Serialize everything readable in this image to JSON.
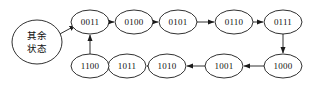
{
  "diagram": {
    "type": "state-transition-diagram",
    "background_color": "#ffffff",
    "stroke_color": "#1a1a1a",
    "text_color": "#111111",
    "nodes": [
      {
        "id": "other",
        "label_line1": "其余",
        "label_line2": "状态",
        "cx": 37,
        "cy": 42,
        "rx": 25,
        "ry": 22
      },
      {
        "id": "s0011",
        "label": "0011",
        "cx": 90,
        "cy": 22,
        "rx": 19,
        "ry": 12
      },
      {
        "id": "s0100",
        "label": "0100",
        "cx": 134,
        "cy": 22,
        "rx": 19,
        "ry": 12
      },
      {
        "id": "s0101",
        "label": "0101",
        "cx": 178,
        "cy": 22,
        "rx": 19,
        "ry": 12
      },
      {
        "id": "s0110",
        "label": "0110",
        "cx": 234,
        "cy": 22,
        "rx": 19,
        "ry": 12
      },
      {
        "id": "s0111",
        "label": "0111",
        "cx": 283,
        "cy": 22,
        "rx": 19,
        "ry": 12
      },
      {
        "id": "s1000",
        "label": "1000",
        "cx": 283,
        "cy": 66,
        "rx": 19,
        "ry": 12
      },
      {
        "id": "s1001",
        "label": "1001",
        "cx": 224,
        "cy": 66,
        "rx": 19,
        "ry": 12
      },
      {
        "id": "s1010",
        "label": "1010",
        "cx": 167,
        "cy": 66,
        "rx": 19,
        "ry": 12
      },
      {
        "id": "s1011",
        "label": "1011",
        "cx": 127,
        "cy": 66,
        "rx": 19,
        "ry": 12
      },
      {
        "id": "s1100",
        "label": "1100",
        "cx": 90,
        "cy": 66,
        "rx": 19,
        "ry": 12
      }
    ],
    "edges": [
      {
        "id": "other-to-0011",
        "from": "other",
        "to": "s0011",
        "x1": 58,
        "y1": 34,
        "x2": 74,
        "y2": 25,
        "direction": "diagonal-up-right"
      },
      {
        "id": "0011-to-0100",
        "from": "s0011",
        "to": "s0100",
        "x1": 109,
        "y1": 22,
        "x2": 114,
        "y2": 22,
        "direction": "right"
      },
      {
        "id": "0100-to-0101",
        "from": "s0100",
        "to": "s0101",
        "x1": 153,
        "y1": 22,
        "x2": 158,
        "y2": 22,
        "direction": "right"
      },
      {
        "id": "0101-to-0110",
        "from": "s0101",
        "to": "s0110",
        "x1": 197,
        "y1": 22,
        "x2": 214,
        "y2": 22,
        "direction": "right"
      },
      {
        "id": "0110-to-0111",
        "from": "s0110",
        "to": "s0111",
        "x1": 253,
        "y1": 22,
        "x2": 263,
        "y2": 22,
        "direction": "right"
      },
      {
        "id": "0111-to-1000",
        "from": "s0111",
        "to": "s1000",
        "x1": 283,
        "y1": 34,
        "x2": 283,
        "y2": 53,
        "direction": "down"
      },
      {
        "id": "1000-to-1001",
        "from": "s1000",
        "to": "s1001",
        "x1": 264,
        "y1": 66,
        "x2": 244,
        "y2": 66,
        "direction": "left"
      },
      {
        "id": "1001-to-1010",
        "from": "s1001",
        "to": "s1010",
        "x1": 205,
        "y1": 66,
        "x2": 187,
        "y2": 66,
        "direction": "left"
      },
      {
        "id": "1010-to-1011",
        "from": "s1010",
        "to": "s1011",
        "x1": 148,
        "y1": 66,
        "x2": 147,
        "y2": 66,
        "direction": "left"
      },
      {
        "id": "1011-to-1100",
        "from": "s1011",
        "to": "s1100",
        "x1": 108,
        "y1": 66,
        "x2": 110,
        "y2": 66,
        "direction": "left"
      },
      {
        "id": "1100-to-0011",
        "from": "s1100",
        "to": "s0011",
        "x1": 90,
        "y1": 54,
        "x2": 90,
        "y2": 35,
        "direction": "up"
      }
    ]
  }
}
